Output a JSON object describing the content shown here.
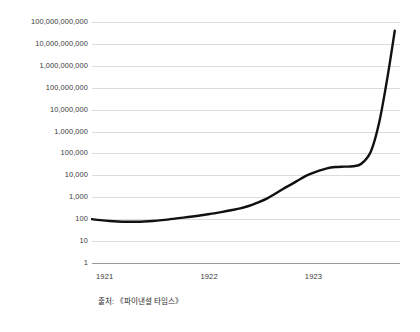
{
  "chart_data": {
    "type": "line",
    "title": "",
    "subtitle": "",
    "xlabel": "",
    "ylabel": "",
    "yscale": "log",
    "ylim": [
      1,
      100000000000
    ],
    "xlim": [
      1921.0,
      1923.95
    ],
    "grid": true,
    "legend": "none",
    "line_color": "#111111",
    "grid_color": "#dcdcdc",
    "axis_color": "#9a9a9a",
    "text_color": "#3a3a3a",
    "caption": "출처: 《파이낸셜 타임스》",
    "y_ticks": [
      "100,000,000,000",
      "10,000,000,000",
      "1,000,000,000",
      "100,000,000",
      "10,000,000",
      "1,000,000",
      "100,000",
      "10,000",
      "1,000",
      "100",
      "10",
      "1"
    ],
    "y_tick_values": [
      100000000000,
      10000000000,
      1000000000,
      100000000,
      10000000,
      1000000,
      100000,
      10000,
      1000,
      100,
      10,
      1
    ],
    "x_ticks": [
      "1921",
      "1922",
      "1923"
    ],
    "x_tick_values": [
      1921,
      1922,
      1923
    ],
    "series": [
      {
        "name": "Price index",
        "x": [
          1921.0,
          1921.08,
          1921.17,
          1921.25,
          1921.33,
          1921.42,
          1921.5,
          1921.58,
          1921.67,
          1921.75,
          1921.83,
          1921.92,
          1922.0,
          1922.08,
          1922.17,
          1922.25,
          1922.33,
          1922.42,
          1922.5,
          1922.58,
          1922.67,
          1922.75,
          1922.83,
          1922.92,
          1923.0,
          1923.08,
          1923.17,
          1923.25,
          1923.33,
          1923.42,
          1923.5,
          1923.58,
          1923.67,
          1923.75,
          1923.83,
          1923.9
        ],
        "y": [
          100,
          90,
          82,
          78,
          76,
          76,
          78,
          82,
          90,
          100,
          112,
          125,
          140,
          160,
          185,
          215,
          255,
          310,
          400,
          560,
          850,
          1400,
          2400,
          4200,
          7000,
          11000,
          16000,
          21000,
          24000,
          25000,
          26000,
          34000,
          120000,
          2500000,
          300000000,
          40000000000
        ]
      }
    ],
    "annotations": []
  },
  "caption": {
    "source_label": "출처: 《파이낸셜 타임스》"
  }
}
